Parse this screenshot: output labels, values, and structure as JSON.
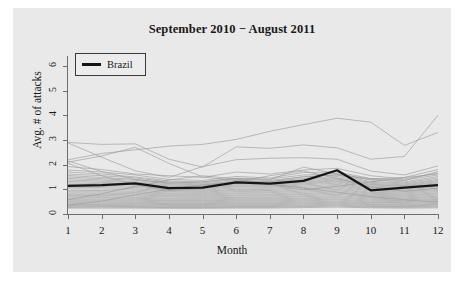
{
  "chart_data": {
    "type": "line",
    "title": "September 2010 − August 2011",
    "xlabel": "Month",
    "ylabel": "Avg. # of attacks",
    "xlim": [
      1,
      12
    ],
    "ylim": [
      0,
      6.4
    ],
    "x": [
      1,
      2,
      3,
      4,
      5,
      6,
      7,
      8,
      9,
      10,
      11,
      12
    ],
    "xticks": [
      "1",
      "2",
      "3",
      "4",
      "5",
      "6",
      "7",
      "8",
      "9",
      "10",
      "11",
      "12"
    ],
    "yticks": [
      "0",
      "1",
      "2",
      "3",
      "4",
      "5",
      "6"
    ],
    "grid": false,
    "legend": {
      "position": "top-left",
      "entries": [
        "Brazil"
      ]
    },
    "highlight_color": "#151515",
    "background_color": "#e9e9e9",
    "other_series_color": "#9a9a9a",
    "series": [
      {
        "name": "Brazil",
        "highlight": true,
        "values": [
          1.14,
          1.17,
          1.24,
          1.05,
          1.07,
          1.28,
          1.23,
          1.34,
          1.77,
          0.96,
          1.07,
          1.17
        ]
      },
      {
        "name": "country-01",
        "highlight": false,
        "values": [
          2.2,
          2.45,
          2.6,
          2.75,
          2.82,
          3.02,
          3.35,
          3.62,
          3.88,
          3.72,
          2.78,
          3.3
        ]
      },
      {
        "name": "country-02",
        "highlight": false,
        "values": [
          2.9,
          2.82,
          2.84,
          2.22,
          1.9,
          2.72,
          2.66,
          2.8,
          2.68,
          2.22,
          2.33,
          4.0
        ]
      },
      {
        "name": "country-03",
        "highlight": false,
        "values": [
          2.88,
          2.3,
          1.75,
          1.48,
          1.92,
          2.2,
          2.26,
          2.28,
          2.22,
          1.74,
          1.58,
          1.95
        ]
      },
      {
        "name": "country-04",
        "highlight": false,
        "values": [
          2.1,
          2.35,
          2.7,
          2.05,
          1.5,
          1.35,
          1.3,
          1.52,
          1.58,
          1.4,
          1.35,
          1.72
        ]
      },
      {
        "name": "country-05",
        "highlight": false,
        "values": [
          2.15,
          1.72,
          1.4,
          1.25,
          1.3,
          1.44,
          1.38,
          1.9,
          1.62,
          1.42,
          1.48,
          1.8
        ]
      },
      {
        "name": "country-06",
        "highlight": false,
        "values": [
          1.92,
          1.8,
          1.62,
          1.55,
          1.48,
          1.7,
          1.62,
          1.78,
          1.85,
          1.55,
          1.42,
          1.66
        ]
      },
      {
        "name": "country-07",
        "highlight": false,
        "values": [
          1.78,
          1.7,
          1.58,
          1.4,
          1.36,
          1.52,
          1.46,
          1.68,
          1.7,
          1.44,
          1.38,
          1.58
        ]
      },
      {
        "name": "country-08",
        "highlight": false,
        "values": [
          1.7,
          1.62,
          1.5,
          1.34,
          1.3,
          1.45,
          1.42,
          1.58,
          1.64,
          1.38,
          1.3,
          1.52
        ]
      },
      {
        "name": "country-09",
        "highlight": false,
        "values": [
          1.62,
          1.55,
          1.46,
          1.3,
          1.26,
          1.4,
          1.36,
          1.5,
          1.58,
          1.32,
          1.26,
          1.46
        ]
      },
      {
        "name": "country-10",
        "highlight": false,
        "values": [
          1.56,
          1.48,
          1.4,
          1.26,
          1.22,
          1.34,
          1.32,
          1.44,
          1.52,
          1.28,
          1.22,
          1.4
        ]
      },
      {
        "name": "country-11",
        "highlight": false,
        "values": [
          1.5,
          1.43,
          1.36,
          1.22,
          1.18,
          1.3,
          1.28,
          1.4,
          1.46,
          1.24,
          1.18,
          1.36
        ]
      },
      {
        "name": "country-12",
        "highlight": false,
        "values": [
          1.44,
          1.38,
          1.3,
          1.18,
          1.15,
          1.26,
          1.24,
          1.35,
          1.42,
          1.2,
          1.15,
          1.31
        ]
      },
      {
        "name": "country-13",
        "highlight": false,
        "values": [
          1.38,
          1.33,
          1.26,
          1.14,
          1.11,
          1.22,
          1.2,
          1.3,
          1.38,
          1.17,
          1.12,
          1.27
        ]
      },
      {
        "name": "country-14",
        "highlight": false,
        "values": [
          1.32,
          1.28,
          1.21,
          1.1,
          1.07,
          1.18,
          1.16,
          1.26,
          1.34,
          1.13,
          1.08,
          1.23
        ]
      },
      {
        "name": "country-15",
        "highlight": false,
        "values": [
          1.26,
          1.23,
          1.17,
          1.06,
          1.04,
          1.14,
          1.12,
          1.22,
          1.3,
          1.09,
          1.05,
          1.19
        ]
      },
      {
        "name": "country-16",
        "highlight": false,
        "values": [
          1.2,
          1.18,
          1.12,
          1.02,
          1.0,
          1.1,
          1.08,
          1.18,
          1.25,
          1.05,
          1.01,
          1.14
        ]
      },
      {
        "name": "country-17",
        "highlight": false,
        "values": [
          1.14,
          1.12,
          1.07,
          0.98,
          0.96,
          1.05,
          1.04,
          1.13,
          1.2,
          1.01,
          0.97,
          1.1
        ]
      },
      {
        "name": "country-18",
        "highlight": false,
        "values": [
          1.08,
          1.07,
          1.02,
          0.94,
          0.92,
          1.0,
          0.99,
          1.08,
          1.15,
          0.97,
          0.93,
          1.05
        ]
      },
      {
        "name": "country-19",
        "highlight": false,
        "values": [
          1.02,
          1.01,
          0.97,
          0.9,
          0.88,
          0.96,
          0.95,
          1.03,
          1.1,
          0.93,
          0.89,
          1.0
        ]
      },
      {
        "name": "country-20",
        "highlight": false,
        "values": [
          0.96,
          0.95,
          0.92,
          0.85,
          0.84,
          0.91,
          0.9,
          0.98,
          1.05,
          0.88,
          0.85,
          0.96
        ]
      },
      {
        "name": "country-21",
        "highlight": false,
        "values": [
          0.9,
          0.9,
          0.87,
          0.81,
          0.8,
          0.86,
          0.86,
          0.93,
          1.0,
          0.84,
          0.81,
          0.91
        ]
      },
      {
        "name": "country-22",
        "highlight": false,
        "values": [
          0.85,
          0.85,
          0.82,
          0.77,
          0.76,
          0.82,
          0.81,
          0.88,
          0.95,
          0.8,
          0.77,
          0.86
        ]
      },
      {
        "name": "country-23",
        "highlight": false,
        "values": [
          0.8,
          0.8,
          0.77,
          0.73,
          0.72,
          0.77,
          0.77,
          0.83,
          0.9,
          0.76,
          0.73,
          0.82
        ]
      },
      {
        "name": "country-24",
        "highlight": false,
        "values": [
          0.75,
          0.75,
          0.73,
          0.69,
          0.68,
          0.73,
          0.73,
          0.79,
          0.85,
          0.72,
          0.69,
          0.77
        ]
      },
      {
        "name": "country-25",
        "highlight": false,
        "values": [
          0.7,
          0.7,
          0.68,
          0.64,
          0.64,
          0.68,
          0.68,
          0.74,
          0.8,
          0.68,
          0.65,
          0.72
        ]
      },
      {
        "name": "country-26",
        "highlight": false,
        "values": [
          0.65,
          0.66,
          0.64,
          0.6,
          0.6,
          0.64,
          0.64,
          0.7,
          0.75,
          0.64,
          0.61,
          0.68
        ]
      },
      {
        "name": "country-27",
        "highlight": false,
        "values": [
          0.61,
          0.61,
          0.6,
          0.56,
          0.56,
          0.6,
          0.6,
          0.65,
          0.7,
          0.6,
          0.57,
          0.63
        ]
      },
      {
        "name": "country-28",
        "highlight": false,
        "values": [
          0.57,
          0.57,
          0.56,
          0.53,
          0.53,
          0.56,
          0.56,
          0.61,
          0.66,
          0.56,
          0.54,
          0.59
        ]
      },
      {
        "name": "country-29",
        "highlight": false,
        "values": [
          0.53,
          0.53,
          0.52,
          0.49,
          0.49,
          0.52,
          0.52,
          0.57,
          0.61,
          0.52,
          0.5,
          0.55
        ]
      },
      {
        "name": "country-30",
        "highlight": false,
        "values": [
          0.49,
          0.49,
          0.48,
          0.45,
          0.45,
          0.48,
          0.48,
          0.53,
          0.57,
          0.48,
          0.46,
          0.51
        ]
      },
      {
        "name": "country-31",
        "highlight": false,
        "values": [
          0.45,
          0.45,
          0.44,
          0.42,
          0.42,
          0.44,
          0.44,
          0.49,
          0.52,
          0.45,
          0.43,
          0.47
        ]
      },
      {
        "name": "country-32",
        "highlight": false,
        "values": [
          0.41,
          0.41,
          0.41,
          0.38,
          0.38,
          0.41,
          0.41,
          0.45,
          0.48,
          0.41,
          0.39,
          0.43
        ]
      },
      {
        "name": "country-33",
        "highlight": false,
        "values": [
          0.38,
          0.38,
          0.37,
          0.35,
          0.35,
          0.37,
          0.37,
          0.41,
          0.44,
          0.38,
          0.36,
          0.39
        ]
      },
      {
        "name": "country-34",
        "highlight": false,
        "values": [
          0.34,
          0.34,
          0.34,
          0.32,
          0.32,
          0.34,
          0.34,
          0.37,
          0.4,
          0.34,
          0.33,
          0.36
        ]
      },
      {
        "name": "country-35",
        "highlight": false,
        "values": [
          0.31,
          0.31,
          0.3,
          0.29,
          0.29,
          0.3,
          0.3,
          0.33,
          0.36,
          0.31,
          0.3,
          0.32
        ]
      },
      {
        "name": "country-36",
        "highlight": false,
        "values": [
          0.27,
          0.28,
          0.27,
          0.26,
          0.26,
          0.27,
          0.27,
          0.3,
          0.32,
          0.28,
          0.27,
          0.29
        ]
      },
      {
        "name": "country-37",
        "highlight": false,
        "values": [
          0.24,
          0.24,
          0.24,
          0.23,
          0.23,
          0.24,
          0.24,
          0.26,
          0.28,
          0.25,
          0.24,
          0.25
        ]
      },
      {
        "name": "country-38",
        "highlight": false,
        "values": [
          0.36,
          0.52,
          0.78,
          1.0,
          1.18,
          1.3,
          1.22,
          1.06,
          0.88,
          0.7,
          0.58,
          0.48
        ]
      },
      {
        "name": "country-39",
        "highlight": false,
        "values": [
          2.05,
          1.55,
          1.18,
          0.95,
          1.02,
          1.3,
          1.55,
          1.74,
          1.44,
          1.1,
          0.92,
          1.05
        ]
      },
      {
        "name": "country-40",
        "highlight": false,
        "values": [
          0.58,
          0.82,
          1.12,
          1.38,
          1.55,
          1.42,
          1.2,
          0.98,
          1.12,
          1.3,
          1.48,
          1.62
        ]
      }
    ]
  },
  "legend": {
    "label": "Brazil"
  }
}
